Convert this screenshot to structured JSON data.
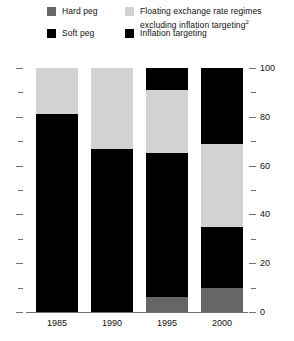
{
  "legend": {
    "items": [
      {
        "key": "hard_peg",
        "label": "Hard peg",
        "color": "#666666",
        "swatch_name": "legend-swatch-hard-peg"
      },
      {
        "key": "soft_peg",
        "label": "Soft peg",
        "color": "#000000",
        "swatch_name": "legend-swatch-soft-peg"
      },
      {
        "key": "floating",
        "label": "Floating exchange rate regimes\nexcluding inflation targeting",
        "footnote": "2",
        "color": "#d2d2d2",
        "swatch_name": "legend-swatch-floating"
      },
      {
        "key": "inflation_targeting",
        "label": "Inflation targeting",
        "color": "#000000",
        "swatch_name": "legend-swatch-inflation-targeting"
      }
    ]
  },
  "axis": {
    "major_ticks": [
      "0",
      "20",
      "40",
      "60",
      "80",
      "100"
    ],
    "major_values": [
      0,
      20,
      40,
      60,
      80,
      100
    ],
    "minor_values": [
      10,
      30,
      50,
      70,
      90
    ],
    "ymin": 0,
    "ymax": 100,
    "label_side": "right"
  },
  "chart_data": {
    "type": "bar",
    "stacked": true,
    "title": "",
    "subtitle": "",
    "xlabel": "",
    "ylabel": "",
    "ylim": [
      0,
      100
    ],
    "grid": false,
    "legend_position": "top",
    "categories": [
      "1985",
      "1990",
      "1995",
      "2000"
    ],
    "series": [
      {
        "name": "Hard peg",
        "color": "#666666",
        "values": [
          0,
          0,
          6,
          10
        ]
      },
      {
        "name": "Soft peg",
        "color": "#000000",
        "values": [
          81,
          67,
          59,
          25
        ]
      },
      {
        "name": "Floating exchange rate regimes excluding inflation targeting",
        "color": "#d2d2d2",
        "values": [
          19,
          33,
          26,
          34
        ]
      },
      {
        "name": "Inflation targeting",
        "color": "#000000",
        "values": [
          0,
          0,
          9,
          31
        ]
      }
    ]
  }
}
